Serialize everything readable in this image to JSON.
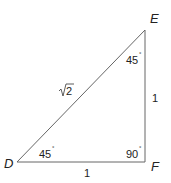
{
  "diagram": {
    "type": "right-triangle",
    "vertices": {
      "D": {
        "label": "D"
      },
      "E": {
        "label": "E"
      },
      "F": {
        "label": "F"
      }
    },
    "angles": {
      "D": {
        "value": "45",
        "unit": "°"
      },
      "E": {
        "value": "45",
        "unit": "°"
      },
      "F": {
        "value": "90",
        "unit": "°"
      }
    },
    "sides": {
      "DE": {
        "label": "2",
        "radical": true
      },
      "EF": {
        "label": "1"
      },
      "DF": {
        "label": "1"
      }
    },
    "colors": {
      "stroke": "#666666",
      "text": "#222222"
    }
  }
}
